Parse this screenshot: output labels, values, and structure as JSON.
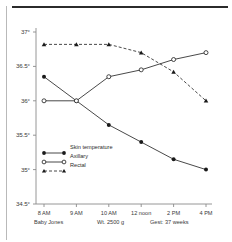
{
  "figure": {
    "caption_left": "Baby Jones",
    "caption_center": "Wt. 2500 g",
    "caption_right": "Gest: 37 weeks"
  },
  "chart_data": {
    "type": "line",
    "title": "",
    "xlabel": "",
    "ylabel": "",
    "grid": false,
    "legend_position": "inside-lower-left",
    "x": [
      "8 AM",
      "9 AM",
      "10 AM",
      "12 noon",
      "2 PM",
      "4 PM"
    ],
    "categories": [
      "8 AM",
      "9 AM",
      "10 AM",
      "12 noon",
      "2 PM",
      "4 PM"
    ],
    "ylim": [
      34.5,
      37.0
    ],
    "yticks": [
      34.5,
      35.0,
      35.5,
      36.0,
      36.5,
      37.0
    ],
    "ytick_labels": [
      "34.5°",
      "35°",
      "35.5°",
      "36°",
      "36.5°",
      "37°"
    ],
    "series": [
      {
        "name": "Skin temperature",
        "marker": "filled-circle",
        "line": "solid",
        "color": "#1a1a1a",
        "values": [
          36.35,
          36.0,
          35.65,
          35.4,
          35.15,
          35.0
        ]
      },
      {
        "name": "Axillary",
        "marker": "open-circle",
        "line": "solid",
        "color": "#1a1a1a",
        "values": [
          36.0,
          36.0,
          36.35,
          36.45,
          36.6,
          36.7
        ]
      },
      {
        "name": "Rectal",
        "marker": "filled-triangle",
        "line": "dashed",
        "color": "#1a1a1a",
        "values": [
          36.82,
          36.82,
          36.82,
          36.7,
          36.42,
          36.0
        ]
      }
    ]
  }
}
